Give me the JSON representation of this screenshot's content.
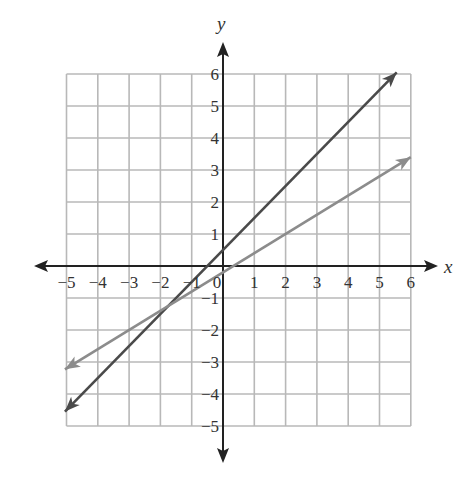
{
  "chart_data": {
    "type": "line",
    "title": "",
    "xlabel": "x",
    "ylabel": "y",
    "xlim": [
      -5,
      6
    ],
    "ylim": [
      -5,
      6
    ],
    "grid": true,
    "x_ticks": [
      "-5",
      "-4",
      "-3",
      "-2",
      "-1",
      "0",
      "1",
      "2",
      "3",
      "4",
      "5",
      "6"
    ],
    "y_ticks": [
      "6",
      "5",
      "4",
      "3",
      "2",
      "1",
      "-1",
      "-2",
      "-3",
      "-4",
      "-5"
    ],
    "series": [
      {
        "name": "steeper line",
        "equation": "y = x + 0.5",
        "color": "#4a4a4a",
        "x": [
          -5.05,
          5.55
        ],
        "y": [
          -4.55,
          6.05
        ]
      },
      {
        "name": "shallower line",
        "equation": "y = 0.6x - 0.2",
        "color": "#8c8c8c",
        "x": [
          -5.05,
          6.0
        ],
        "y": [
          -3.23,
          3.4
        ]
      }
    ],
    "intersection": {
      "x": -1.75,
      "y": -1.25
    }
  },
  "colors": {
    "grid": "#b8b8b8",
    "axis": "#222222"
  }
}
